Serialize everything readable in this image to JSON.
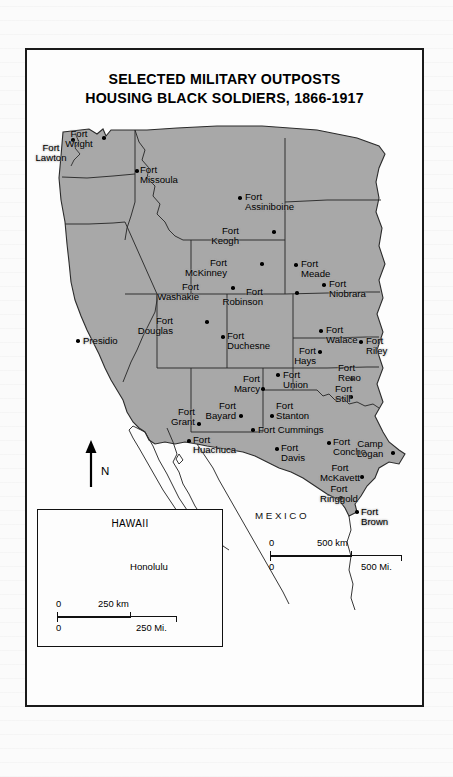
{
  "figure": {
    "title_line1": "SELECTED MILITARY OUTPOSTS",
    "title_line2": "HOUSING BLACK SOLDIERS, 1866-1917",
    "country_label": "MEXICO",
    "north_arrow_label": "N"
  },
  "colors": {
    "land_fill": "#a8a8a8",
    "outline": "#2b2b2b",
    "page_background": "#fbfbfb",
    "frame_border": "#1a1a1a",
    "marker": "#000000"
  },
  "places": [
    {
      "name": "Fort Lawton",
      "label_lines": [
        "Fort",
        "Lawton"
      ],
      "dot": [
        46,
        90
      ],
      "label": [
        24,
        93
      ],
      "align": "center"
    },
    {
      "name": "Fort Wright",
      "label_lines": [
        "Fort",
        "Wright"
      ],
      "dot": [
        77,
        88
      ],
      "label": [
        52,
        79
      ],
      "align": "center"
    },
    {
      "name": "Fort Missoula",
      "label_lines": [
        "Fort",
        "Missoula"
      ],
      "dot": [
        110,
        121
      ],
      "label": [
        113,
        115
      ],
      "align": "left"
    },
    {
      "name": "Fort Assiniboine",
      "label_lines": [
        "Fort",
        "Assiniboine"
      ],
      "dot": [
        213,
        148
      ],
      "label": [
        218,
        142
      ],
      "align": "left"
    },
    {
      "name": "Fort Keogh",
      "label_lines": [
        "Fort",
        "Keogh"
      ],
      "dot": [
        247,
        182
      ],
      "label": [
        212,
        176
      ],
      "align": "right"
    },
    {
      "name": "Fort McKinney",
      "label_lines": [
        "Fort",
        "McKinney"
      ],
      "dot": [
        235,
        214
      ],
      "label": [
        200,
        208
      ],
      "align": "right"
    },
    {
      "name": "Fort Meade",
      "label_lines": [
        "Fort",
        "Meade"
      ],
      "dot": [
        269,
        215
      ],
      "label": [
        274,
        209
      ],
      "align": "left"
    },
    {
      "name": "Fort Washakie",
      "label_lines": [
        "Fort",
        "Washakie"
      ],
      "dot": [
        206,
        238
      ],
      "label": [
        172,
        232
      ],
      "align": "right"
    },
    {
      "name": "Fort Robinson",
      "label_lines": [
        "Fort",
        "Robinson"
      ],
      "dot": [
        270,
        243
      ],
      "label": [
        236,
        237
      ],
      "align": "right"
    },
    {
      "name": "Fort Niobrara",
      "label_lines": [
        "Fort",
        "Niobrara"
      ],
      "dot": [
        297,
        235
      ],
      "label": [
        302,
        229
      ],
      "align": "left"
    },
    {
      "name": "Fort Douglas",
      "label_lines": [
        "Fort",
        "Douglas"
      ],
      "dot": [
        180,
        272
      ],
      "label": [
        146,
        266
      ],
      "align": "right"
    },
    {
      "name": "Fort Duchesne",
      "label_lines": [
        "Fort",
        "Duchesne"
      ],
      "dot": [
        196,
        287
      ],
      "label": [
        200,
        281
      ],
      "align": "left"
    },
    {
      "name": "Presidio",
      "label_lines": [
        "Presidio"
      ],
      "dot": [
        51,
        291
      ],
      "label": [
        56,
        286
      ],
      "align": "left"
    },
    {
      "name": "Fort Walace",
      "label_lines": [
        "Fort",
        "Walace"
      ],
      "dot": [
        294,
        281
      ],
      "label": [
        299,
        275
      ],
      "align": "left"
    },
    {
      "name": "Fort Riley",
      "label_lines": [
        "Fort",
        "Riley"
      ],
      "dot": [
        334,
        292
      ],
      "label": [
        339,
        286
      ],
      "align": "left"
    },
    {
      "name": "Fort Hays",
      "label_lines": [
        "Fort",
        "Hays"
      ],
      "dot": [
        293,
        302
      ],
      "label": [
        289,
        296
      ],
      "align": "right"
    },
    {
      "name": "Fort Reno",
      "label_lines": [
        "Fort",
        "Reno"
      ],
      "dot": [
        325,
        329
      ],
      "label": [
        311,
        313
      ],
      "align": "left"
    },
    {
      "name": "Fort Still",
      "label_lines": [
        "Fort",
        "Still"
      ],
      "dot": [
        324,
        347
      ],
      "label": [
        308,
        334
      ],
      "align": "left"
    },
    {
      "name": "Fort Marcy",
      "label_lines": [
        "Fort",
        "Marcy"
      ],
      "dot": [
        236,
        339
      ],
      "label": [
        233,
        324
      ],
      "align": "right"
    },
    {
      "name": "Fort Union",
      "label_lines": [
        "Fort",
        "Union"
      ],
      "dot": [
        251,
        325
      ],
      "label": [
        256,
        320
      ],
      "align": "left"
    },
    {
      "name": "Fort Bayard",
      "label_lines": [
        "Fort",
        "Bayard"
      ],
      "dot": [
        214,
        366
      ],
      "label": [
        209,
        351
      ],
      "align": "right"
    },
    {
      "name": "Fort Stanton",
      "label_lines": [
        "Fort",
        "Stanton"
      ],
      "dot": [
        245,
        366
      ],
      "label": [
        249,
        351
      ],
      "align": "left"
    },
    {
      "name": "Fort Grant",
      "label_lines": [
        "Fort",
        "Grant"
      ],
      "dot": [
        172,
        374
      ],
      "label": [
        168,
        357
      ],
      "align": "right"
    },
    {
      "name": "Fort Cummings",
      "label_lines": [
        "Fort Cummings"
      ],
      "dot": [
        226,
        380
      ],
      "label": [
        231,
        375
      ],
      "align": "left"
    },
    {
      "name": "Fort Huachuca",
      "label_lines": [
        "Fort",
        "Huachuca"
      ],
      "dot": [
        162,
        391
      ],
      "label": [
        166,
        385
      ],
      "align": "left"
    },
    {
      "name": "Fort Davis",
      "label_lines": [
        "Fort",
        "Davis"
      ],
      "dot": [
        250,
        399
      ],
      "label": [
        254,
        393
      ],
      "align": "left"
    },
    {
      "name": "Fort Concho",
      "label_lines": [
        "Fort",
        "Concho"
      ],
      "dot": [
        302,
        393
      ],
      "label": [
        306,
        387
      ],
      "align": "left"
    },
    {
      "name": "Camp Logan",
      "label_lines": [
        "Camp",
        "Logan"
      ],
      "dot": [
        366,
        403
      ],
      "label": [
        343,
        389
      ],
      "align": "center"
    },
    {
      "name": "Fort McKavett",
      "label_lines": [
        "Fort",
        "McKavett"
      ],
      "dot": [
        335,
        427
      ],
      "label": [
        313,
        413
      ],
      "align": "center"
    },
    {
      "name": "Fort Ringgold",
      "label_lines": [
        "Fort",
        "Ringgold"
      ],
      "dot": [
        314,
        448
      ],
      "label": [
        312,
        434
      ],
      "align": "center"
    },
    {
      "name": "Fort Brown",
      "label_lines": [
        "Fort",
        "Brown"
      ],
      "dot": [
        330,
        462
      ],
      "label": [
        334,
        457
      ],
      "align": "left"
    }
  ],
  "scalebars": {
    "main": [
      {
        "name": "kilometers",
        "zero": "0",
        "value": "500 km",
        "length_px": 82
      },
      {
        "name": "miles",
        "zero": "0",
        "value": "500 Mi.",
        "length_px": 132
      }
    ],
    "hawaii": [
      {
        "name": "kilometers",
        "zero": "0",
        "value": "250 km",
        "length_px": 74
      },
      {
        "name": "miles",
        "zero": "0",
        "value": "250 Mi.",
        "length_px": 120
      }
    ]
  },
  "hawaii_inset": {
    "title": "HAWAII",
    "city": "Honolulu"
  }
}
